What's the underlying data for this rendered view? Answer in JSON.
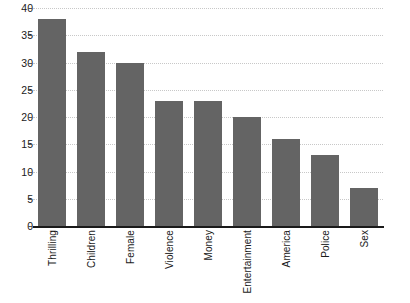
{
  "chart_data": {
    "type": "bar",
    "title": "",
    "xlabel": "",
    "ylabel": "",
    "ylim": [
      0,
      40
    ],
    "ytick_step": 5,
    "yticks": [
      "40",
      "35",
      "30",
      "25",
      "20",
      "15",
      "10",
      "5",
      "0"
    ],
    "grid": true,
    "legend": "none",
    "orientation": "vertical",
    "bar_color": "#646464",
    "axis_color": "#1a1a1a",
    "gridline_color": "#c8c8c8",
    "categories": [
      "Thrilling",
      "Children",
      "Female",
      "Violence",
      "Money",
      "Entertainment",
      "America",
      "Police",
      "Sex"
    ],
    "values": [
      38,
      32,
      30,
      23,
      23,
      20,
      16,
      13,
      7
    ]
  }
}
